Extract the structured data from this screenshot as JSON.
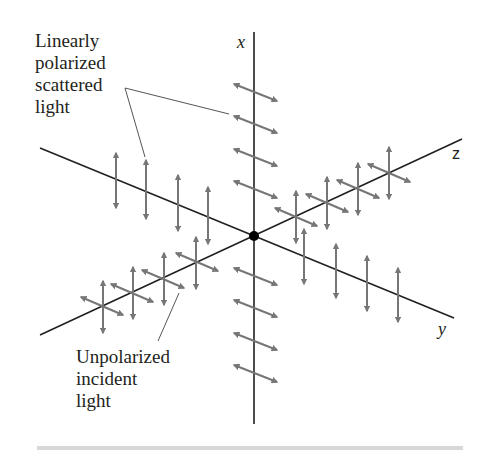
{
  "diagram": {
    "labels": {
      "scattered": "Linearly\npolarized\nscattered\nlight",
      "incident": "Unpolarized\nincident\nlight"
    },
    "axes": {
      "x": "x",
      "y": "y",
      "z": "z"
    },
    "colors": {
      "axis": "#231f20",
      "arrow": "#767676",
      "leader": "#555555",
      "origin": "#000000",
      "footer_rule": "#d8d8d8"
    }
  }
}
